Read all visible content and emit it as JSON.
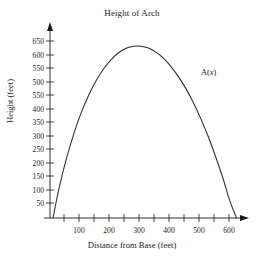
{
  "chart_data": {
    "type": "line",
    "title": "Height of Arch",
    "xlabel": "Distance from Base (feet)",
    "ylabel": "Height (feet)",
    "xlim": [
      0,
      650
    ],
    "ylim": [
      0,
      680
    ],
    "grid": false,
    "legend_position": "none",
    "x_major_ticks": [
      100,
      200,
      300,
      400,
      500,
      600
    ],
    "x_major_tick_labels": [
      "100",
      "200",
      "300",
      "400",
      "500",
      "600"
    ],
    "x_minor_ticks": [
      50,
      150,
      250,
      350,
      450,
      550
    ],
    "y_ticks": [
      650,
      600,
      550,
      500,
      450,
      400,
      350,
      300,
      250,
      200,
      150,
      100,
      50
    ],
    "y_tick_labels": [
      "650",
      "600",
      "550",
      "500",
      "550",
      "400",
      "350",
      "300",
      "250",
      "200",
      "150",
      "100",
      "50"
    ],
    "annotations": [
      {
        "name": "curve-label",
        "text_prefix": "A(",
        "text_italic": "x",
        "text_suffix": ")",
        "x": 505,
        "y": 540
      }
    ],
    "series": [
      {
        "name": "A(x)",
        "x": [
          10,
          30,
          55,
          80,
          105,
          130,
          155,
          180,
          205,
          230,
          255,
          280,
          305,
          330,
          355,
          380,
          405,
          430,
          455,
          480,
          505,
          530,
          555,
          580,
          600,
          615,
          625
        ],
        "y": [
          0,
          108,
          218,
          310,
          388,
          452,
          505,
          548,
          582,
          607,
          623,
          631,
          631,
          624,
          609,
          587,
          557,
          520,
          476,
          425,
          366,
          300,
          226,
          145,
          72,
          28,
          0
        ]
      }
    ],
    "peak": {
      "x": 310,
      "y": 631
    },
    "roots": [
      10,
      625
    ],
    "curve_color": "#2b2b2b"
  }
}
